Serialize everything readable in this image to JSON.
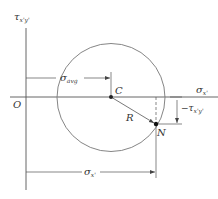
{
  "diagram": {
    "colors": {
      "line": "#555555",
      "circle": "#777777",
      "text": "#333333",
      "point": "#111111"
    },
    "axes": {
      "origin_label": "O",
      "vertical": {
        "symbol": "τ",
        "subscript": "x'y'"
      },
      "horizontal": {
        "symbol": "σ",
        "subscript": "x'"
      }
    },
    "points": {
      "center": {
        "label": "C"
      },
      "state": {
        "label": "N"
      }
    },
    "radius_label": "R",
    "dimensions": {
      "sigma_avg": {
        "symbol": "σ",
        "subscript": "avg"
      },
      "sigma_x": {
        "symbol": "σ",
        "subscript": "x'"
      },
      "tau": {
        "prefix": "−",
        "symbol": "τ",
        "subscript": "x'y'"
      }
    }
  }
}
